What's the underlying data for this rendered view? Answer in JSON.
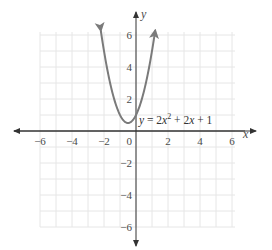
{
  "chart_data": {
    "type": "line",
    "title": "",
    "xlabel": "x",
    "ylabel": "y",
    "xlim": [
      -6,
      6
    ],
    "ylim": [
      -6,
      6
    ],
    "grid": true,
    "grid_step": 1,
    "x_ticks": [
      -6,
      -4,
      -2,
      2,
      4,
      6
    ],
    "y_ticks": [
      -6,
      -4,
      -2,
      2,
      4,
      6
    ],
    "x_tick_labels": [
      "−6",
      "−4",
      "−2",
      "2",
      "4",
      "6"
    ],
    "y_tick_labels": [
      "6",
      "4",
      "2",
      "−2",
      "−4",
      "−6"
    ],
    "origin_label": "0",
    "series": [
      {
        "name": "y = 2x² + 2x + 1",
        "equation": {
          "a": 2,
          "b": 2,
          "c": 1
        },
        "x_range": [
          -2.2,
          1.2
        ],
        "vertex": [
          -0.5,
          0.5
        ],
        "arrows_both_ends": true,
        "color": "#7a7a7a"
      }
    ],
    "annotations": [
      {
        "text": "y = 2x² + 2x + 1",
        "x": -0.2,
        "y": 0.9
      }
    ]
  },
  "labels": {
    "x_axis": "x",
    "y_axis": "y",
    "origin": "0",
    "equation_y": "y",
    "equation_eq": " = 2",
    "equation_x1": "x",
    "equation_sup": "2",
    "equation_rest1": " + 2",
    "equation_x2": "x",
    "equation_rest2": " + 1"
  },
  "colors": {
    "grid": "#e6e6e6",
    "axis": "#333333",
    "curve": "#7a7a7a",
    "text": "#4a4a4a"
  }
}
